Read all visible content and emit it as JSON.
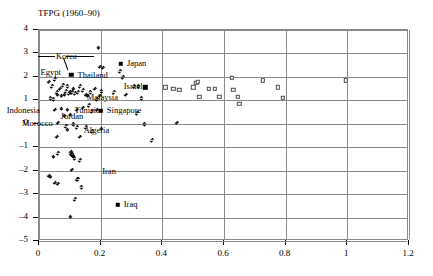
{
  "chart_data": {
    "type": "scatter",
    "title": "TFPG (1960–90)",
    "xlabel": "",
    "ylabel": "",
    "xlim": [
      0,
      1.2
    ],
    "ylim": [
      -5,
      4
    ],
    "xticks": [
      "0",
      "0.2",
      "0.4",
      "0.6",
      "0.8",
      "1",
      "1.2"
    ],
    "xtick_values": [
      0,
      0.2,
      0.4,
      0.6,
      0.8,
      1.0,
      1.2
    ],
    "yticks": [
      "4",
      "3",
      "2",
      "1",
      "0",
      "–1",
      "–2",
      "–3",
      "–4",
      "–5"
    ],
    "ytick_values": [
      4,
      3,
      2,
      1,
      0,
      -1,
      -2,
      -3,
      -4,
      -5
    ],
    "grid": true,
    "legend": "none",
    "series": [
      {
        "name": "diamond-markers",
        "marker": "diamond-filled",
        "points": [
          [
            0.035,
            1.75
          ],
          [
            0.04,
            1.05
          ],
          [
            0.045,
            1.55
          ],
          [
            0.05,
            1.0
          ],
          [
            0.055,
            1.85
          ],
          [
            0.06,
            1.3
          ],
          [
            0.062,
            1.2
          ],
          [
            0.07,
            1.45
          ],
          [
            0.075,
            1.15
          ],
          [
            0.08,
            1.6
          ],
          [
            0.085,
            1.2
          ],
          [
            0.09,
            1.35
          ],
          [
            0.095,
            1.55
          ],
          [
            0.1,
            1.25
          ],
          [
            0.105,
            1.3
          ],
          [
            0.11,
            1.3
          ],
          [
            0.115,
            1.45
          ],
          [
            0.12,
            1.25
          ],
          [
            0.13,
            1.3
          ],
          [
            0.135,
            1.55
          ],
          [
            0.145,
            1.4
          ],
          [
            0.155,
            1.2
          ],
          [
            0.16,
            1.15
          ],
          [
            0.17,
            1.3
          ],
          [
            0.185,
            1.45
          ],
          [
            0.19,
            1.0
          ],
          [
            0.2,
            1.15
          ],
          [
            0.205,
            1.35
          ],
          [
            0.21,
            2.35
          ],
          [
            0.195,
            3.2
          ],
          [
            0.2,
            2.4
          ],
          [
            0.265,
            2.2
          ],
          [
            0.275,
            1.95
          ],
          [
            0.245,
            1.3
          ],
          [
            0.285,
            1.2
          ],
          [
            0.31,
            1.55
          ],
          [
            0.325,
            1.55
          ],
          [
            0.335,
            1.05
          ],
          [
            0.055,
            0.55
          ],
          [
            0.075,
            0.6
          ],
          [
            0.095,
            0.55
          ],
          [
            0.085,
            0.3
          ],
          [
            0.105,
            0.35
          ],
          [
            0.125,
            0.55
          ],
          [
            0.145,
            0.65
          ],
          [
            0.165,
            0.75
          ],
          [
            0.175,
            0.5
          ],
          [
            0.19,
            0.55
          ],
          [
            0.065,
            0.0
          ],
          [
            0.09,
            -0.15
          ],
          [
            0.115,
            -0.05
          ],
          [
            0.125,
            -0.2
          ],
          [
            0.155,
            -0.2
          ],
          [
            0.175,
            -0.35
          ],
          [
            0.205,
            -0.25
          ],
          [
            0.32,
            0.4
          ],
          [
            0.345,
            -0.05
          ],
          [
            0.45,
            0.0
          ],
          [
            0.37,
            -0.75
          ],
          [
            0.06,
            -0.6
          ],
          [
            0.095,
            -0.3
          ],
          [
            0.135,
            -0.6
          ],
          [
            0.05,
            -1.45
          ],
          [
            0.065,
            -1.3
          ],
          [
            0.105,
            -1.3
          ],
          [
            0.11,
            -1.35
          ],
          [
            0.112,
            -1.4
          ],
          [
            0.115,
            -1.45
          ],
          [
            0.118,
            -1.5
          ],
          [
            0.108,
            -1.25
          ],
          [
            0.135,
            -1.6
          ],
          [
            0.11,
            -2.0
          ],
          [
            0.035,
            -2.25
          ],
          [
            0.04,
            -2.3
          ],
          [
            0.055,
            -2.55
          ],
          [
            0.065,
            -2.6
          ],
          [
            0.125,
            -2.4
          ],
          [
            0.13,
            -2.4
          ],
          [
            0.14,
            -2.75
          ],
          [
            0.12,
            -3.25
          ],
          [
            0.105,
            -4.0
          ]
        ]
      },
      {
        "name": "filled-square-markers",
        "marker": "square-filled",
        "points": [
          [
            0.105,
            2.1
          ],
          [
            0.265,
            2.55
          ],
          [
            0.345,
            1.55
          ],
          [
            0.2,
            0.55
          ],
          [
            0.255,
            -3.45
          ]
        ]
      },
      {
        "name": "open-square-markers",
        "marker": "square-open",
        "points": [
          [
            0.41,
            1.55
          ],
          [
            0.435,
            1.5
          ],
          [
            0.455,
            1.45
          ],
          [
            0.5,
            1.55
          ],
          [
            0.51,
            1.75
          ],
          [
            0.515,
            1.8
          ],
          [
            0.52,
            1.15
          ],
          [
            0.55,
            1.5
          ],
          [
            0.57,
            1.5
          ],
          [
            0.585,
            1.15
          ],
          [
            0.625,
            1.95
          ],
          [
            0.63,
            1.45
          ],
          [
            0.645,
            1.15
          ],
          [
            0.65,
            0.85
          ],
          [
            0.725,
            1.85
          ],
          [
            0.775,
            1.55
          ],
          [
            0.79,
            1.1
          ],
          [
            0.995,
            1.85
          ]
        ]
      }
    ],
    "annotations": [
      {
        "text": "Korea",
        "x": 0.055,
        "y": 2.85,
        "leader": true
      },
      {
        "text": "Egypt",
        "x": 0.005,
        "y": 2.15
      },
      {
        "text": "Thailand",
        "x": 0.125,
        "y": 2.05
      },
      {
        "text": "Japan",
        "x": 0.285,
        "y": 2.55
      },
      {
        "text": "Israel",
        "x": 0.275,
        "y": 1.55
      },
      {
        "text": "Malaysia",
        "x": 0.155,
        "y": 1.1
      },
      {
        "text": "Indonesia",
        "x": -0.105,
        "y": 0.55
      },
      {
        "text": "Tunisia",
        "x": 0.115,
        "y": 0.55
      },
      {
        "text": "Singapore",
        "x": 0.22,
        "y": 0.55
      },
      {
        "text": "Jordan",
        "x": 0.07,
        "y": 0.28
      },
      {
        "text": "Morocco",
        "x": -0.055,
        "y": 0.0
      },
      {
        "text": "Algeria",
        "x": 0.145,
        "y": -0.3
      },
      {
        "text": "Iran",
        "x": 0.205,
        "y": -2.05
      },
      {
        "text": "Iraq",
        "x": 0.275,
        "y": -3.45
      }
    ]
  }
}
